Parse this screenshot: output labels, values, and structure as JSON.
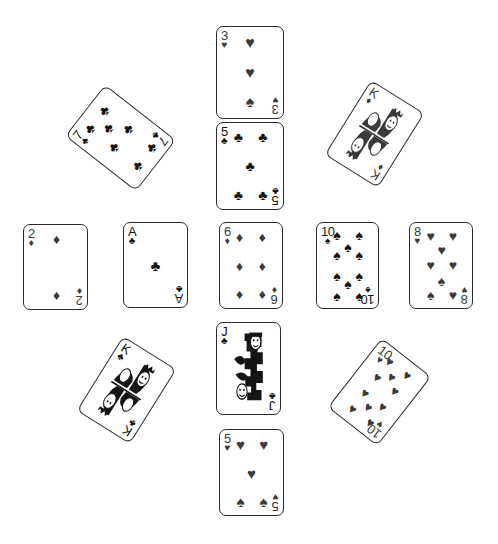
{
  "scene": {
    "title": "Playing cards scattered layout",
    "background_color": "#ffffff",
    "width": 498,
    "height": 544,
    "card_border_color": "#2b2b2b",
    "black_ink": "#141414",
    "gray_ink": "#3a3a3a"
  },
  "suit_glyphs": {
    "hearts": "♥",
    "diamonds": "♦",
    "clubs": "♣",
    "spades": "♠"
  },
  "cards": [
    {
      "id": "three-of-hearts",
      "rank": "3",
      "suit": "hearts",
      "suit_glyph": "♥",
      "corner_suit_glyph": "♥",
      "label": "3 of Hearts",
      "x": 216,
      "y": 26,
      "width": 68,
      "height": 93,
      "rotation": 0,
      "ink": "#3a3a3a",
      "pip_size": 16,
      "pips": [
        {
          "left": 50,
          "top": 14,
          "glyph": "♥"
        },
        {
          "left": 50,
          "top": 50,
          "glyph": "♥"
        },
        {
          "left": 50,
          "top": 86,
          "glyph": "♠"
        }
      ]
    },
    {
      "id": "five-of-clubs",
      "rank": "5",
      "suit": "clubs",
      "suit_glyph": "♣",
      "corner_suit_glyph": "♣",
      "label": "5 of Clubs",
      "x": 216,
      "y": 122,
      "width": 68,
      "height": 88,
      "rotation": 0,
      "ink": "#141414",
      "pip_size": 14,
      "pips": [
        {
          "left": 30,
          "top": 13,
          "glyph": "♣"
        },
        {
          "left": 72,
          "top": 13,
          "glyph": "♣"
        },
        {
          "left": 50,
          "top": 50,
          "glyph": "♣"
        },
        {
          "left": 30,
          "top": 87,
          "glyph": "♣"
        },
        {
          "left": 72,
          "top": 87,
          "glyph": "♣"
        }
      ]
    },
    {
      "id": "seven-of-clubs",
      "rank": "7",
      "suit": "clubs",
      "suit_glyph": "♣",
      "corner_suit_glyph": "♣",
      "label": "7 of Clubs",
      "x": 88,
      "y": 93,
      "width": 65,
      "height": 90,
      "rotation": -52,
      "ink": "#141414",
      "pip_size": 14,
      "pips": [
        {
          "left": 29,
          "top": 13,
          "glyph": "♣"
        },
        {
          "left": 71,
          "top": 13,
          "glyph": "♣"
        },
        {
          "left": 50,
          "top": 30,
          "glyph": "♣"
        },
        {
          "left": 29,
          "top": 50,
          "glyph": "♣"
        },
        {
          "left": 71,
          "top": 50,
          "glyph": "♣"
        },
        {
          "left": 29,
          "top": 87,
          "glyph": "♣"
        },
        {
          "left": 71,
          "top": 87,
          "glyph": "♣"
        }
      ]
    },
    {
      "id": "king-of-diamonds",
      "rank": "K",
      "suit": "diamonds",
      "suit_glyph": "♦",
      "corner_suit_glyph": "♦",
      "label": "King of Diamonds",
      "x": 343,
      "y": 90,
      "width": 63,
      "height": 88,
      "rotation": 32,
      "ink": "#3a3a3a",
      "pip_size": 9,
      "is_face": true,
      "pips": []
    },
    {
      "id": "two-of-diamonds",
      "rank": "2",
      "suit": "diamonds",
      "suit_glyph": "♦",
      "corner_suit_glyph": "♦",
      "label": "2 of Diamonds",
      "x": 23,
      "y": 224,
      "width": 65,
      "height": 86,
      "rotation": 0,
      "ink": "#3a3a3a",
      "pip_size": 14,
      "pips": [
        {
          "left": 52,
          "top": 13,
          "glyph": "♦"
        },
        {
          "left": 52,
          "top": 87,
          "glyph": "♦"
        }
      ]
    },
    {
      "id": "ace-of-clubs",
      "rank": "A",
      "suit": "clubs",
      "suit_glyph": "♣",
      "corner_suit_glyph": "♣",
      "label": "Ace of Clubs",
      "x": 123,
      "y": 222,
      "width": 65,
      "height": 86,
      "rotation": 0,
      "ink": "#141414",
      "pip_size": 15,
      "pips": [
        {
          "left": 50,
          "top": 50,
          "glyph": "♣"
        }
      ]
    },
    {
      "id": "six-of-diamonds",
      "rank": "6",
      "suit": "diamonds",
      "suit_glyph": "♦",
      "corner_suit_glyph": "♦",
      "label": "6 of Diamonds",
      "x": 219,
      "y": 222,
      "width": 64,
      "height": 87,
      "rotation": 0,
      "ink": "#3a3a3a",
      "pip_size": 14,
      "pips": [
        {
          "left": 29,
          "top": 13,
          "glyph": "♦"
        },
        {
          "left": 71,
          "top": 13,
          "glyph": "♦"
        },
        {
          "left": 29,
          "top": 50,
          "glyph": "♦"
        },
        {
          "left": 71,
          "top": 50,
          "glyph": "♦"
        },
        {
          "left": 29,
          "top": 87,
          "glyph": "♦"
        },
        {
          "left": 71,
          "top": 87,
          "glyph": "♦"
        }
      ]
    },
    {
      "id": "ten-of-spades",
      "rank": "10",
      "suit": "spades",
      "suit_glyph": "♠",
      "corner_suit_glyph": "♠",
      "label": "10 of Spades",
      "x": 316,
      "y": 222,
      "width": 63,
      "height": 87,
      "rotation": 0,
      "ink": "#141414",
      "pip_size": 14,
      "pips": [
        {
          "left": 30,
          "top": 11,
          "glyph": "♠"
        },
        {
          "left": 72,
          "top": 11,
          "glyph": "♠"
        },
        {
          "left": 51,
          "top": 26,
          "glyph": "♠"
        },
        {
          "left": 30,
          "top": 37,
          "glyph": "♠"
        },
        {
          "left": 72,
          "top": 37,
          "glyph": "♠"
        },
        {
          "left": 30,
          "top": 63,
          "glyph": "♠"
        },
        {
          "left": 72,
          "top": 63,
          "glyph": "♠"
        },
        {
          "left": 51,
          "top": 74,
          "glyph": "♠"
        },
        {
          "left": 30,
          "top": 89,
          "glyph": "♠"
        },
        {
          "left": 72,
          "top": 89,
          "glyph": "♠"
        }
      ]
    },
    {
      "id": "eight-of-hearts",
      "rank": "8",
      "suit": "hearts",
      "suit_glyph": "♥",
      "corner_suit_glyph": "♥",
      "label": "8 of Hearts",
      "x": 409,
      "y": 222,
      "width": 64,
      "height": 87,
      "rotation": 0,
      "ink": "#3a3a3a",
      "pip_size": 14,
      "pips": [
        {
          "left": 31,
          "top": 12,
          "glyph": "♥"
        },
        {
          "left": 72,
          "top": 12,
          "glyph": "♥"
        },
        {
          "left": 51,
          "top": 30,
          "glyph": "♥"
        },
        {
          "left": 31,
          "top": 49,
          "glyph": "♥"
        },
        {
          "left": 72,
          "top": 49,
          "glyph": "♥"
        },
        {
          "left": 51,
          "top": 70,
          "glyph": "♠"
        },
        {
          "left": 31,
          "top": 88,
          "glyph": "♠"
        },
        {
          "left": 72,
          "top": 88,
          "glyph": "♥"
        }
      ]
    },
    {
      "id": "king-of-clubs",
      "rank": "K",
      "suit": "clubs",
      "suit_glyph": "♣",
      "corner_suit_glyph": "♣",
      "label": "King of Clubs",
      "x": 95,
      "y": 346,
      "width": 63,
      "height": 88,
      "rotation": 32,
      "ink": "#141414",
      "pip_size": 9,
      "is_face": true,
      "pips": []
    },
    {
      "id": "jack-of-clubs",
      "rank": "J",
      "suit": "clubs",
      "suit_glyph": "♣",
      "corner_suit_glyph": "♣",
      "label": "Jack of Clubs",
      "x": 216,
      "y": 322,
      "width": 65,
      "height": 93,
      "rotation": 0,
      "ink": "#141414",
      "pip_size": 10,
      "is_face": true,
      "pips": []
    },
    {
      "id": "ten-of-hearts",
      "rank": "10",
      "suit": "hearts",
      "suit_glyph": "♥",
      "corner_suit_glyph": "♥",
      "label": "10 of Hearts",
      "x": 348,
      "y": 348,
      "width": 63,
      "height": 88,
      "rotation": 38,
      "ink": "#3a3a3a",
      "pip_size": 13,
      "pips": [
        {
          "left": 30,
          "top": 11,
          "glyph": "♥"
        },
        {
          "left": 72,
          "top": 11,
          "glyph": "♥"
        },
        {
          "left": 51,
          "top": 26,
          "glyph": "♥"
        },
        {
          "left": 30,
          "top": 37,
          "glyph": "♥"
        },
        {
          "left": 72,
          "top": 37,
          "glyph": "♥"
        },
        {
          "left": 30,
          "top": 63,
          "glyph": "♥"
        },
        {
          "left": 72,
          "top": 63,
          "glyph": "♥"
        },
        {
          "left": 51,
          "top": 74,
          "glyph": "♥"
        },
        {
          "left": 30,
          "top": 89,
          "glyph": "♥"
        },
        {
          "left": 72,
          "top": 89,
          "glyph": "♥"
        }
      ]
    },
    {
      "id": "five-of-hearts",
      "rank": "5",
      "suit": "hearts",
      "suit_glyph": "♥",
      "corner_suit_glyph": "♥",
      "label": "5 of Hearts",
      "x": 219,
      "y": 429,
      "width": 65,
      "height": 87,
      "rotation": 0,
      "ink": "#3a3a3a",
      "pip_size": 15,
      "pips": [
        {
          "left": 30,
          "top": 13,
          "glyph": "♥"
        },
        {
          "left": 72,
          "top": 13,
          "glyph": "♥"
        },
        {
          "left": 50,
          "top": 50,
          "glyph": "♥"
        },
        {
          "left": 30,
          "top": 87,
          "glyph": "♠"
        },
        {
          "left": 72,
          "top": 87,
          "glyph": "♠"
        }
      ]
    }
  ]
}
